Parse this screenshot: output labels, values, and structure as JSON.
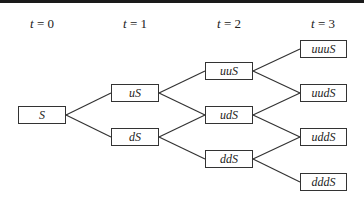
{
  "time_labels": [
    {
      "var": "t",
      "eq": " = 0",
      "x": 42
    },
    {
      "var": "t",
      "eq": " = 1",
      "x": 135
    },
    {
      "var": "t",
      "eq": " = 2",
      "x": 229
    },
    {
      "var": "t",
      "eq": " = 3",
      "x": 323
    }
  ],
  "nodes": [
    {
      "id": "S",
      "label": "S",
      "x": 18,
      "y": 106,
      "w": 48,
      "h": 18
    },
    {
      "id": "uS",
      "label": "uS",
      "x": 111,
      "y": 84,
      "w": 48,
      "h": 18
    },
    {
      "id": "dS",
      "label": "dS",
      "x": 111,
      "y": 128,
      "w": 48,
      "h": 18
    },
    {
      "id": "uuS",
      "label": "uuS",
      "x": 205,
      "y": 62,
      "w": 48,
      "h": 18
    },
    {
      "id": "udS",
      "label": "udS",
      "x": 205,
      "y": 106,
      "w": 48,
      "h": 18
    },
    {
      "id": "ddS",
      "label": "ddS",
      "x": 205,
      "y": 150,
      "w": 48,
      "h": 18
    },
    {
      "id": "uuuS",
      "label": "uuuS",
      "x": 300,
      "y": 40,
      "w": 47,
      "h": 18
    },
    {
      "id": "uudS",
      "label": "uudS",
      "x": 300,
      "y": 84,
      "w": 47,
      "h": 18
    },
    {
      "id": "uddS",
      "label": "uddS",
      "x": 300,
      "y": 128,
      "w": 47,
      "h": 18
    },
    {
      "id": "dddS",
      "label": "dddS",
      "x": 300,
      "y": 173,
      "w": 47,
      "h": 18
    }
  ],
  "edges": [
    [
      "S",
      "uS"
    ],
    [
      "S",
      "dS"
    ],
    [
      "uS",
      "uuS"
    ],
    [
      "uS",
      "udS"
    ],
    [
      "dS",
      "udS"
    ],
    [
      "dS",
      "ddS"
    ],
    [
      "uuS",
      "uuuS"
    ],
    [
      "uuS",
      "uudS"
    ],
    [
      "udS",
      "uudS"
    ],
    [
      "udS",
      "uddS"
    ],
    [
      "ddS",
      "uddS"
    ],
    [
      "ddS",
      "dddS"
    ]
  ]
}
